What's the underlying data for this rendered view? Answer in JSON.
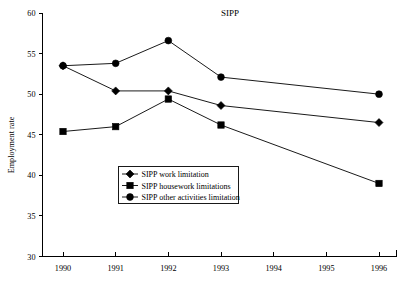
{
  "chart_data": {
    "type": "line",
    "title": "SIPP",
    "xlabel": "",
    "ylabel": "Employment rate",
    "x": [
      1990,
      1991,
      1992,
      1993,
      1996
    ],
    "xticks": [
      "1990",
      "1991",
      "1992",
      "1993",
      "1994",
      "1995",
      "1996"
    ],
    "xtick_values": [
      1990,
      1991,
      1992,
      1993,
      1994,
      1995,
      1996
    ],
    "xlim": [
      1989.65,
      1996.5
    ],
    "yticks": [
      "30",
      "35",
      "40",
      "45",
      "50",
      "55",
      "60"
    ],
    "ytick_values": [
      30,
      35,
      40,
      45,
      50,
      55,
      60
    ],
    "ylim": [
      30,
      60
    ],
    "grid": false,
    "legend_position": "center-left-lower",
    "series": [
      {
        "name": "SIPP work limitation",
        "marker": "diamond",
        "color": "#000000",
        "values": [
          53.5,
          50.4,
          50.4,
          48.6,
          46.5
        ]
      },
      {
        "name": "SIPP housework limitations",
        "marker": "square",
        "color": "#000000",
        "values": [
          45.4,
          46.0,
          49.4,
          46.2,
          39.0
        ]
      },
      {
        "name": "SIPP other activities limitation",
        "marker": "circle",
        "color": "#000000",
        "values": [
          53.5,
          53.8,
          56.6,
          52.1,
          50.0
        ]
      }
    ]
  },
  "legend": {
    "items": [
      {
        "label": "SIPP work limitation",
        "marker": "diamond"
      },
      {
        "label": "SIPP housework limitations",
        "marker": "square"
      },
      {
        "label": "SIPP other activities limitation",
        "marker": "circle"
      }
    ]
  }
}
